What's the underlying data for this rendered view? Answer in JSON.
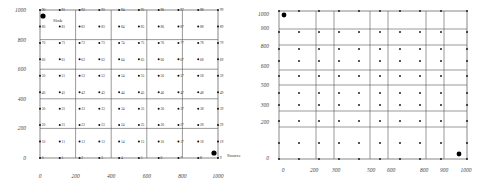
{
  "chart_data": [
    {
      "type": "scatter",
      "title": "",
      "description": "10x10 grid of numbered sensor nodes with Sink at top-left and Source at bottom-right",
      "xlabel": "",
      "ylabel": "",
      "xlim": [
        0,
        1000
      ],
      "ylim": [
        0,
        1000
      ],
      "x_ticks": [
        "0",
        "200",
        "400",
        "600",
        "800",
        "1000"
      ],
      "y_ticks": [
        "0",
        "200",
        "400",
        "600",
        "800",
        "1000"
      ],
      "grid": true,
      "node_labels_rows": [
        [
          "0",
          "1",
          "2",
          "3",
          "4",
          "5",
          "6",
          "7",
          "8",
          "9"
        ],
        [
          "10",
          "11",
          "12",
          "13",
          "14",
          "15",
          "16",
          "17",
          "18",
          "19"
        ],
        [
          "20",
          "21",
          "22",
          "23",
          "24",
          "25",
          "26",
          "27",
          "28",
          "29"
        ],
        [
          "30",
          "31",
          "32",
          "33",
          "34",
          "35",
          "36",
          "37",
          "38",
          "39"
        ],
        [
          "40",
          "41",
          "42",
          "43",
          "44",
          "45",
          "46",
          "47",
          "48",
          "49"
        ],
        [
          "50",
          "51",
          "52",
          "53",
          "54",
          "55",
          "56",
          "57",
          "58",
          "59"
        ],
        [
          "60",
          "61",
          "62",
          "63",
          "64",
          "65",
          "66",
          "67",
          "68",
          "69"
        ],
        [
          "70",
          "71",
          "72",
          "73",
          "74",
          "75",
          "76",
          "77",
          "78",
          "79"
        ],
        [
          "80",
          "81",
          "82",
          "83",
          "84",
          "85",
          "86",
          "87",
          "88",
          "89"
        ],
        [
          "90",
          "91",
          "92",
          "93",
          "94",
          "95",
          "96",
          "97",
          "98",
          "99"
        ]
      ],
      "annotations": [
        {
          "text": "Sink",
          "position": "top-left"
        },
        {
          "text": "Source",
          "position": "bottom-right"
        }
      ]
    },
    {
      "type": "scatter",
      "title": "",
      "description": "Irregular grid of unlabeled nodes with large markers at top-left and bottom-right",
      "xlabel": "",
      "ylabel": "",
      "xlim": [
        0,
        1000
      ],
      "ylim": [
        0,
        1000
      ],
      "x_ticks": [
        "0",
        "200",
        "300",
        "500",
        "600",
        "800",
        "900",
        "1000"
      ],
      "y_ticks": [
        "0",
        "200",
        "300",
        "500",
        "600",
        "800",
        "900",
        "1000"
      ],
      "grid": true
    }
  ],
  "left": {
    "x_ticks": [
      "0",
      "200",
      "400",
      "600",
      "800",
      "1000"
    ],
    "y_ticks": [
      "1000",
      "800",
      "600",
      "400",
      "200",
      "0"
    ],
    "sink_label": "Sink",
    "source_label": "Source"
  },
  "right": {
    "x_ticks": [
      "0",
      "200",
      "300",
      "500",
      "600",
      "800",
      "900",
      "1000"
    ],
    "y_ticks": [
      "1000",
      "900",
      "800",
      "600",
      "500",
      "300",
      "200",
      "0"
    ]
  }
}
